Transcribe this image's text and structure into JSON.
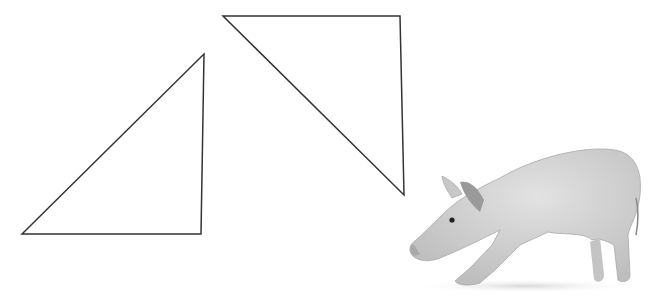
{
  "canvas": {
    "width": 658,
    "height": 308,
    "background": "#ffffff"
  },
  "shapes": [
    {
      "name": "triangle-left",
      "points": "22,234 204,54 201,234",
      "stroke": "#333333"
    },
    {
      "name": "triangle-right",
      "points": "223,16 400,16 404,195",
      "stroke": "#333333"
    }
  ],
  "image": {
    "subject": "piglet",
    "description": "Grayscale photo of a young pig stretching/bowing, facing left"
  }
}
